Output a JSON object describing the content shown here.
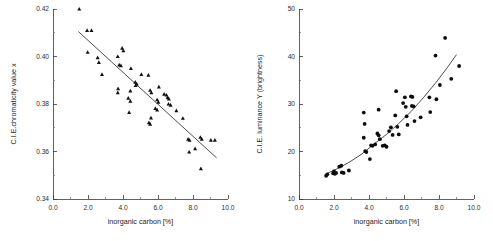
{
  "figure": {
    "title": "",
    "panel_count": 2
  },
  "chart_data": [
    {
      "type": "scatter",
      "panel": "left",
      "title": "",
      "xlabel": "inorganic carbon [%]",
      "ylabel": "C.I.E.chromaticity value x",
      "xlim": [
        0.0,
        10.0
      ],
      "ylim": [
        0.34,
        0.42
      ],
      "xticks": [
        0.0,
        2.0,
        4.0,
        6.0,
        8.0,
        10.0
      ],
      "xticklabels": [
        "0.0",
        "2.0",
        "4.0",
        "6.0",
        "8.0",
        "10.0"
      ],
      "yticks": [
        0.34,
        0.36,
        0.38,
        0.4,
        0.42
      ],
      "yticklabels": [
        "0.34",
        "0.36",
        "0.38",
        "0.40",
        "0.42"
      ],
      "minor_ticks": true,
      "grid": false,
      "legend": null,
      "marker": "triangle",
      "marker_color": "#111111",
      "fit": {
        "kind": "line",
        "label": "linear regression",
        "x": [
          1.45,
          9.35
        ],
        "y": [
          0.4105,
          0.3573
        ]
      },
      "points": [
        {
          "x": 1.5,
          "y": 0.42
        },
        {
          "x": 1.95,
          "y": 0.411
        },
        {
          "x": 2.2,
          "y": 0.411
        },
        {
          "x": 1.98,
          "y": 0.4018
        },
        {
          "x": 2.55,
          "y": 0.3995
        },
        {
          "x": 2.62,
          "y": 0.3975
        },
        {
          "x": 2.8,
          "y": 0.3925
        },
        {
          "x": 3.7,
          "y": 0.4
        },
        {
          "x": 3.95,
          "y": 0.4035
        },
        {
          "x": 4.02,
          "y": 0.4025
        },
        {
          "x": 3.78,
          "y": 0.3965
        },
        {
          "x": 3.88,
          "y": 0.3962
        },
        {
          "x": 4.45,
          "y": 0.395
        },
        {
          "x": 5.05,
          "y": 0.3925
        },
        {
          "x": 5.45,
          "y": 0.3922
        },
        {
          "x": 3.72,
          "y": 0.3865
        },
        {
          "x": 3.7,
          "y": 0.3848
        },
        {
          "x": 4.42,
          "y": 0.3855
        },
        {
          "x": 4.7,
          "y": 0.3892
        },
        {
          "x": 4.78,
          "y": 0.3885
        },
        {
          "x": 4.72,
          "y": 0.3878
        },
        {
          "x": 5.55,
          "y": 0.3858
        },
        {
          "x": 5.62,
          "y": 0.3848
        },
        {
          "x": 6.05,
          "y": 0.3872
        },
        {
          "x": 6.35,
          "y": 0.3842
        },
        {
          "x": 6.48,
          "y": 0.3838
        },
        {
          "x": 6.55,
          "y": 0.3828
        },
        {
          "x": 6.62,
          "y": 0.3822
        },
        {
          "x": 4.3,
          "y": 0.3825
        },
        {
          "x": 4.42,
          "y": 0.3812
        },
        {
          "x": 4.35,
          "y": 0.3765
        },
        {
          "x": 5.95,
          "y": 0.3818
        },
        {
          "x": 6.02,
          "y": 0.3808
        },
        {
          "x": 5.85,
          "y": 0.3782
        },
        {
          "x": 5.95,
          "y": 0.3775
        },
        {
          "x": 6.6,
          "y": 0.38
        },
        {
          "x": 6.72,
          "y": 0.3795
        },
        {
          "x": 7.05,
          "y": 0.3772
        },
        {
          "x": 5.6,
          "y": 0.3742
        },
        {
          "x": 5.48,
          "y": 0.3722
        },
        {
          "x": 5.55,
          "y": 0.3715
        },
        {
          "x": 7.42,
          "y": 0.374
        },
        {
          "x": 7.72,
          "y": 0.3652
        },
        {
          "x": 7.8,
          "y": 0.3648
        },
        {
          "x": 7.78,
          "y": 0.3598
        },
        {
          "x": 8.12,
          "y": 0.3612
        },
        {
          "x": 8.42,
          "y": 0.366
        },
        {
          "x": 8.5,
          "y": 0.3652
        },
        {
          "x": 8.45,
          "y": 0.3528
        },
        {
          "x": 9.02,
          "y": 0.3648
        },
        {
          "x": 9.25,
          "y": 0.3648
        }
      ]
    },
    {
      "type": "scatter",
      "panel": "right",
      "title": "",
      "xlabel": "inorganic carbon [%]",
      "ylabel": "C.I.E. luminance Y (brightness)",
      "xlim": [
        0.0,
        10.0
      ],
      "ylim": [
        10,
        50
      ],
      "xticks": [
        0.0,
        2.0,
        4.0,
        6.0,
        8.0,
        10.0
      ],
      "xticklabels": [
        "0.0",
        "2.0",
        "4.0",
        "6.0",
        "8.0",
        "10.0"
      ],
      "yticks": [
        10,
        20,
        30,
        40,
        50
      ],
      "yticklabels": [
        "10",
        "20",
        "30",
        "40",
        "50"
      ],
      "minor_ticks": true,
      "grid": false,
      "legend": null,
      "marker": "circle",
      "marker_color": "#0d0d0d",
      "fit": {
        "kind": "curve",
        "label": "exponential fit",
        "x": [
          1.5,
          2.2,
          2.9,
          3.6,
          4.3,
          5.0,
          5.7,
          6.4,
          7.1,
          7.8,
          8.5,
          9.0
        ],
        "y": [
          15.2,
          16.4,
          17.8,
          19.5,
          21.6,
          23.6,
          25.9,
          28.4,
          31.3,
          34.4,
          37.8,
          40.4
        ]
      },
      "points": [
        {
          "x": 1.55,
          "y": 14.9
        },
        {
          "x": 1.62,
          "y": 15.2
        },
        {
          "x": 1.95,
          "y": 15.4
        },
        {
          "x": 2.0,
          "y": 15.8
        },
        {
          "x": 2.05,
          "y": 15.3
        },
        {
          "x": 2.12,
          "y": 15.5
        },
        {
          "x": 2.3,
          "y": 16.8
        },
        {
          "x": 2.42,
          "y": 17.0
        },
        {
          "x": 2.45,
          "y": 15.6
        },
        {
          "x": 2.55,
          "y": 15.5
        },
        {
          "x": 2.85,
          "y": 16.0
        },
        {
          "x": 3.7,
          "y": 28.2
        },
        {
          "x": 3.75,
          "y": 25.8
        },
        {
          "x": 3.7,
          "y": 22.9
        },
        {
          "x": 3.78,
          "y": 20.1
        },
        {
          "x": 3.85,
          "y": 19.9
        },
        {
          "x": 4.05,
          "y": 18.4
        },
        {
          "x": 4.12,
          "y": 21.3
        },
        {
          "x": 4.2,
          "y": 21.2
        },
        {
          "x": 4.35,
          "y": 21.5
        },
        {
          "x": 4.55,
          "y": 28.8
        },
        {
          "x": 4.48,
          "y": 23.8
        },
        {
          "x": 4.55,
          "y": 23.4
        },
        {
          "x": 4.62,
          "y": 22.6
        },
        {
          "x": 4.78,
          "y": 21.2
        },
        {
          "x": 4.9,
          "y": 21.3
        },
        {
          "x": 5.0,
          "y": 21.0
        },
        {
          "x": 5.15,
          "y": 24.3
        },
        {
          "x": 5.25,
          "y": 25.1
        },
        {
          "x": 5.35,
          "y": 23.5
        },
        {
          "x": 5.55,
          "y": 32.7
        },
        {
          "x": 5.5,
          "y": 27.6
        },
        {
          "x": 5.62,
          "y": 25.2
        },
        {
          "x": 5.7,
          "y": 23.6
        },
        {
          "x": 5.95,
          "y": 30.2
        },
        {
          "x": 6.05,
          "y": 31.4
        },
        {
          "x": 6.1,
          "y": 29.4
        },
        {
          "x": 6.15,
          "y": 27.4
        },
        {
          "x": 6.2,
          "y": 25.6
        },
        {
          "x": 6.4,
          "y": 31.6
        },
        {
          "x": 6.48,
          "y": 31.5
        },
        {
          "x": 6.45,
          "y": 29.6
        },
        {
          "x": 6.55,
          "y": 29.5
        },
        {
          "x": 6.6,
          "y": 26.4
        },
        {
          "x": 6.95,
          "y": 27.2
        },
        {
          "x": 7.45,
          "y": 31.4
        },
        {
          "x": 7.5,
          "y": 28.3
        },
        {
          "x": 7.8,
          "y": 40.2
        },
        {
          "x": 7.85,
          "y": 31.0
        },
        {
          "x": 8.05,
          "y": 34.0
        },
        {
          "x": 8.35,
          "y": 43.9
        },
        {
          "x": 8.7,
          "y": 35.3
        },
        {
          "x": 9.15,
          "y": 38.0
        }
      ]
    }
  ]
}
